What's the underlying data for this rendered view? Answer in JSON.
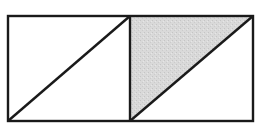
{
  "diagram": {
    "canvas": {
      "width": 260,
      "height": 124
    },
    "outer_rect": {
      "x": 8,
      "y": 16,
      "width": 245,
      "height": 105
    },
    "divider_x": 130,
    "left_square": {
      "diagonal": {
        "x1": 8,
        "y1": 121,
        "x2": 130,
        "y2": 16
      },
      "shaded": false
    },
    "right_square": {
      "diagonal": {
        "x1": 130,
        "y1": 121,
        "x2": 253,
        "y2": 16
      },
      "shaded_triangle": [
        [
          130,
          16
        ],
        [
          253,
          16
        ],
        [
          130,
          121
        ]
      ],
      "shaded": true
    },
    "colors": {
      "stroke": "#1a1a1a",
      "shade": "#d6d6d6",
      "background": "#ffffff"
    },
    "stroke_width": 2.4
  }
}
